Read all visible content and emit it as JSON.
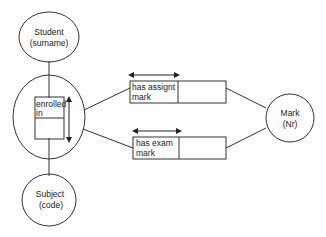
{
  "diagram": {
    "type": "object-role model / entity-relationship",
    "entities": [
      {
        "id": "student",
        "line1": "Student",
        "line2": "(surname)"
      },
      {
        "id": "subject",
        "line1": "Subject",
        "line2": "(code)"
      },
      {
        "id": "mark",
        "line1": "Mark",
        "line2": "(Nr)"
      }
    ],
    "relationships": [
      {
        "id": "enrolled",
        "line1": "enrolled",
        "line2": "in",
        "connects": [
          "student",
          "subject"
        ],
        "nested": true
      },
      {
        "id": "assign",
        "line1": "has assignt",
        "line2": "mark",
        "connects": [
          "enrolled",
          "mark"
        ]
      },
      {
        "id": "exam",
        "line1": "has exam",
        "line2": "mark",
        "connects": [
          "enrolled",
          "mark"
        ]
      }
    ],
    "colors": {
      "stroke": "#333333",
      "text": "#222222",
      "background": "#ffffff"
    }
  }
}
